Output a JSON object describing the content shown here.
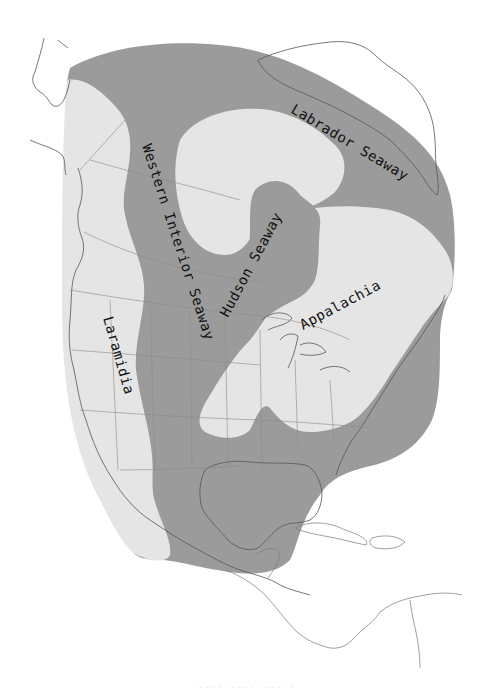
{
  "map": {
    "title": "Late Cretaceous North America",
    "labels": {
      "western_interior_seaway": "Western Interior Seaway",
      "labrador_seaway": "Labrador Seaway",
      "hudson_seaway": "Hudson Seaway",
      "laramidia": "Laramidia",
      "appalachia": "Appalachia"
    },
    "colors": {
      "seaway": "#9b9b9b",
      "landmass": "#e5e5e5",
      "background": "#ffffff",
      "coastline": "#555555",
      "borders": "#8a8a8a"
    },
    "caption": "· · · · · · · · · · · · · · · ·"
  }
}
